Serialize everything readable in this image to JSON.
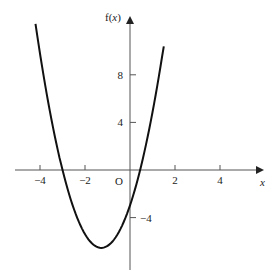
{
  "chart_data": {
    "type": "line",
    "title": "",
    "xlabel": "x",
    "ylabel": "f(x)",
    "origin_label": "O",
    "x_ticks": [
      -4,
      -2,
      2,
      4
    ],
    "x_tick_labels": [
      "−4",
      "−2",
      "2",
      "4"
    ],
    "y_ticks": [
      8,
      4,
      -4
    ],
    "y_tick_labels": [
      "8",
      "4",
      "−4"
    ],
    "xlim": [
      -4.9,
      5.8
    ],
    "ylim": [
      -8.5,
      13
    ],
    "grid": false,
    "legend": null,
    "series": [
      {
        "name": "f(x)",
        "description": "upward-opening parabola with roots near x=-3 and x=0.45, vertex near (-1.27, -6.2), y-intercept near -3",
        "x": [
          -4.2,
          -4.0,
          -3.5,
          -3.0,
          -2.5,
          -2.0,
          -1.5,
          -1.27,
          -1.0,
          -0.5,
          0.0,
          0.45,
          1.0,
          1.5
        ],
        "y": [
          11.6,
          9.6,
          4.3,
          0.0,
          -3.2,
          -5.4,
          -6.4,
          -6.6,
          -6.5,
          -5.4,
          -3.0,
          0.0,
          5.2,
          10.4
        ]
      }
    ],
    "colors": {
      "curve": "#111111",
      "axis": "#333333"
    }
  }
}
